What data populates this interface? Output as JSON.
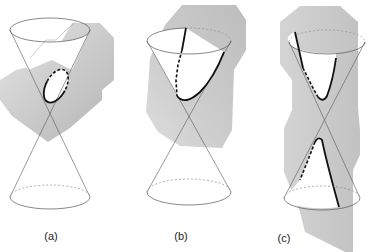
{
  "figure": {
    "panels": [
      {
        "id": "a",
        "label": "(a)",
        "conic": "ellipse",
        "apex": [
          50,
          117
        ],
        "top_ellipse": {
          "cx": 50,
          "cy": 30,
          "rx": 40,
          "ry": 12
        },
        "bottom_ellipse": {
          "cx": 50,
          "cy": 197,
          "rx": 40,
          "ry": 12
        },
        "plane_polygon": "75,24 100,24 112,38 112,78 100,88 100,98 68,126 48,142 15,118 2,100 2,80 18,70 42,64 60,44",
        "section": {
          "cx": 56,
          "cy": 86,
          "rx": 10,
          "ry": 18,
          "rotate": 28
        }
      },
      {
        "id": "b",
        "label": "(b)",
        "conic": "parabola",
        "apex": [
          188,
          117
        ],
        "top_ellipse": {
          "cx": 189,
          "cy": 41,
          "rx": 42,
          "ry": 13
        },
        "bottom_ellipse": {
          "cx": 189,
          "cy": 192,
          "rx": 42,
          "ry": 13
        },
        "plane_polygon": "182,5 235,5 245,20 245,50 233,70 232,130 222,148 178,145 158,130 145,110 148,88 150,58 165,25",
        "section_visible": "M186,28 L182,50",
        "section_hidden": "M182,50 L178,65 L176,80 L177,96",
        "section_curve": "M177,96 Q185,106 200,92 Q214,78 224,52"
      },
      {
        "id": "c",
        "label": "(c)",
        "conic": "hyperbola",
        "apex": [
          327,
          120
        ],
        "top_ellipse": {
          "cx": 327,
          "cy": 42,
          "rx": 38,
          "ry": 12
        },
        "bottom_ellipse": {
          "cx": 322,
          "cy": 198,
          "rx": 38,
          "ry": 12
        },
        "plane_polygon": "300,6 340,6 358,22 358,108 360,130 360,155 353,170 353,252 345,252 305,230 300,210 284,170 284,128 292,110 292,80 280,64 280,22",
        "upper_visible": "M295,32 L303,68",
        "upper_hidden": "M303,68 L313,88 L318,97",
        "upper_curve": "M318,97 Q323,103 327,96 Q333,80 336,58",
        "lower_curve": "M315,142 Q318,136 322,140 Q326,160 339,207",
        "lower_hidden": "M315,142 L308,160 L300,180"
      }
    ],
    "colors": {
      "plane": "#cfcfcf",
      "plane_dark": "#b9b9b9",
      "line": "#555555",
      "section": "#111111",
      "label": "#222222"
    }
  }
}
